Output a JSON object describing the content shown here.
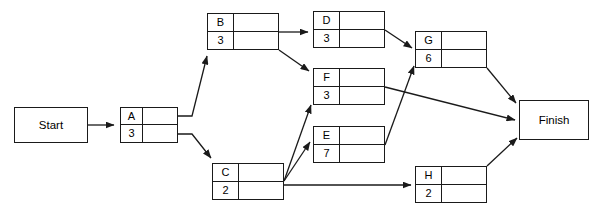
{
  "diagram": {
    "type": "activity-on-node-network",
    "stroke_color": "#1a1a1a",
    "background_color": "#ffffff",
    "start": {
      "label": "Start",
      "x": 14,
      "y": 107,
      "w": 74,
      "h": 36
    },
    "finish": {
      "label": "Finish",
      "x": 519,
      "y": 100,
      "w": 70,
      "h": 40
    },
    "nodes": [
      {
        "id": "A",
        "label": "A",
        "duration": "3",
        "x": 120,
        "y": 107,
        "w": 58,
        "h": 36,
        "label_col_w": 22
      },
      {
        "id": "B",
        "label": "B",
        "duration": "3",
        "x": 207,
        "y": 13,
        "w": 72,
        "h": 37,
        "label_col_w": 26
      },
      {
        "id": "C",
        "label": "C",
        "duration": "2",
        "x": 212,
        "y": 163,
        "w": 72,
        "h": 37,
        "label_col_w": 26
      },
      {
        "id": "D",
        "label": "D",
        "duration": "3",
        "x": 313,
        "y": 11,
        "w": 72,
        "h": 37,
        "label_col_w": 26
      },
      {
        "id": "F",
        "label": "F",
        "duration": "3",
        "x": 313,
        "y": 68,
        "w": 72,
        "h": 37,
        "label_col_w": 26
      },
      {
        "id": "E",
        "label": "E",
        "duration": "7",
        "x": 313,
        "y": 126,
        "w": 72,
        "h": 37,
        "label_col_w": 26
      },
      {
        "id": "G",
        "label": "G",
        "duration": "6",
        "x": 415,
        "y": 31,
        "w": 72,
        "h": 37,
        "label_col_w": 26
      },
      {
        "id": "H",
        "label": "H",
        "duration": "2",
        "x": 415,
        "y": 166,
        "w": 72,
        "h": 37,
        "label_col_w": 26
      }
    ],
    "edges": [
      {
        "id": "start-a",
        "from": "Start",
        "to": "A",
        "points": "88,125 114,125"
      },
      {
        "id": "a-b",
        "from": "A",
        "to": "B",
        "points": "178,116 192,116 207,56"
      },
      {
        "id": "a-c",
        "from": "A",
        "to": "C",
        "points": "178,134 192,134 211,158"
      },
      {
        "id": "b-d",
        "from": "B",
        "to": "D",
        "points": "279,32 308,32"
      },
      {
        "id": "b-f",
        "from": "B",
        "to": "F",
        "points": "279,50 309,71"
      },
      {
        "id": "d-g",
        "from": "D",
        "to": "G",
        "points": "385,30 412,48"
      },
      {
        "id": "c-f",
        "from": "C",
        "to": "F",
        "points": "284,181 311,105"
      },
      {
        "id": "c-e",
        "from": "C",
        "to": "E",
        "points": "284,181 310,142"
      },
      {
        "id": "c-h",
        "from": "C",
        "to": "H",
        "points": "284,185 411,185"
      },
      {
        "id": "e-g",
        "from": "E",
        "to": "G",
        "points": "385,145 414,66"
      },
      {
        "id": "f-finish",
        "from": "F",
        "to": "Finish",
        "points": "385,87 515,120"
      },
      {
        "id": "g-finish",
        "from": "G",
        "to": "Finish",
        "points": "487,68 516,103"
      },
      {
        "id": "h-finish",
        "from": "H",
        "to": "Finish",
        "points": "487,166 517,138"
      }
    ]
  }
}
